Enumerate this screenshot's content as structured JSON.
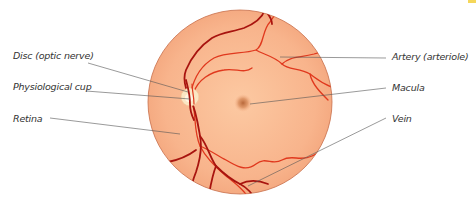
{
  "diagram": {
    "type": "labeled anatomical diagram",
    "colors": {
      "fundus": "#f8b48c",
      "fundus_edge": "#c86e4a",
      "artery": "#e0391e",
      "vein": "#a8140f",
      "disc": "#fbe6c3",
      "macula": "#c0703e",
      "leader": "#555555",
      "label_text": "#333333",
      "corner_tab": "#f5d75a"
    },
    "labels_left": [
      {
        "id": "disc",
        "text": "Disc (optic nerve)"
      },
      {
        "id": "cup",
        "text": "Physiological cup"
      },
      {
        "id": "retina",
        "text": "Retina"
      }
    ],
    "labels_right": [
      {
        "id": "artery",
        "text": "Artery (arteriole)"
      },
      {
        "id": "macula",
        "text": "Macula"
      },
      {
        "id": "vein",
        "text": "Vein"
      }
    ]
  }
}
